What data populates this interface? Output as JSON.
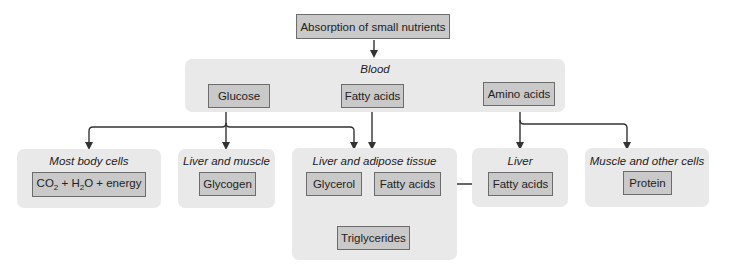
{
  "diagram": {
    "top": {
      "label": "Absorption of small nutrients"
    },
    "blood": {
      "title": "Blood",
      "nodes": [
        {
          "label": "Glucose"
        },
        {
          "label": "Fatty acids"
        },
        {
          "label": "Amino acids"
        }
      ]
    },
    "destinations": {
      "most_body_cells": {
        "title": "Most body cells",
        "product": {
          "co2": "CO",
          "sub2": "2",
          "plus1": " + H",
          "sub2b": "2",
          "rest": "O + energy"
        }
      },
      "liver_and_muscle": {
        "title": "Liver and muscle",
        "product": "Glycogen"
      },
      "liver_and_adipose": {
        "title": "Liver and adipose tissue",
        "nodes": [
          "Glycerol",
          "Fatty acids"
        ],
        "product": "Triglycerides"
      },
      "liver": {
        "title": "Liver",
        "product": "Fatty acids"
      },
      "muscle_and_other": {
        "title": "Muscle and other cells",
        "product": "Protein"
      }
    },
    "colors": {
      "panel": "#e9e9e9",
      "box": "#c9c9c9",
      "border": "#6c6c6c",
      "arrow": "#333333"
    }
  }
}
